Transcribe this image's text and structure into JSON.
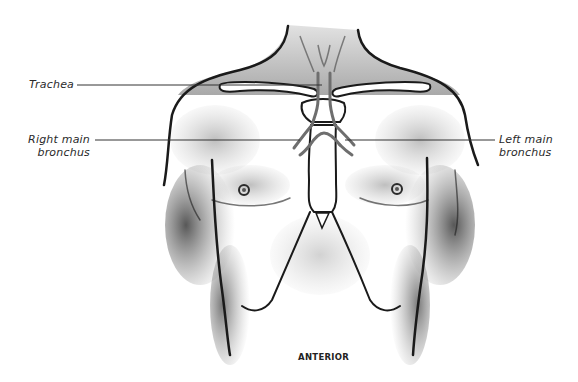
{
  "figure": {
    "view": "ANTERIOR"
  },
  "labels": {
    "trachea": "Trachea",
    "right_main_bronchus_line1": "Right main",
    "right_main_bronchus_line2": "bronchus",
    "left_main_bronchus_line1": "Left main",
    "left_main_bronchus_line2": "bronchus"
  },
  "caption": "ANTERIOR",
  "colors": {
    "outline": "#1a1a1a",
    "airway": "#6e6e6e",
    "shading": "#9a9a9a",
    "leader_line": "#333333",
    "background": "#ffffff"
  }
}
